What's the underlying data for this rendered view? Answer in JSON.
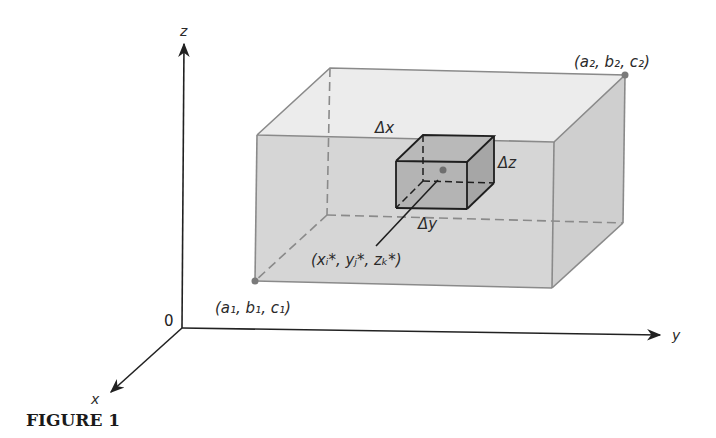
{
  "figure": {
    "caption": "FIGURE 1"
  },
  "axes": {
    "x_label": "x",
    "y_label": "y",
    "z_label": "z",
    "origin_label": "0"
  },
  "box": {
    "corner_min_label": "(a₁, b₁, c₁)",
    "corner_max_label": "(a₂, b₂, c₂)"
  },
  "subbox": {
    "dx_label": "Δx",
    "dy_label": "Δy",
    "dz_label": "Δz",
    "sample_point_label": "(xᵢ*, yⱼ*, zₖ*)"
  },
  "colors": {
    "front_face": "#d6d6d6",
    "top_face": "#ececec",
    "side_face": "#cfcfcf",
    "subbox_face": "#b4b4b4",
    "edge": "#8a8a8a",
    "axis": "#222222",
    "point": "#7a7a7a"
  }
}
